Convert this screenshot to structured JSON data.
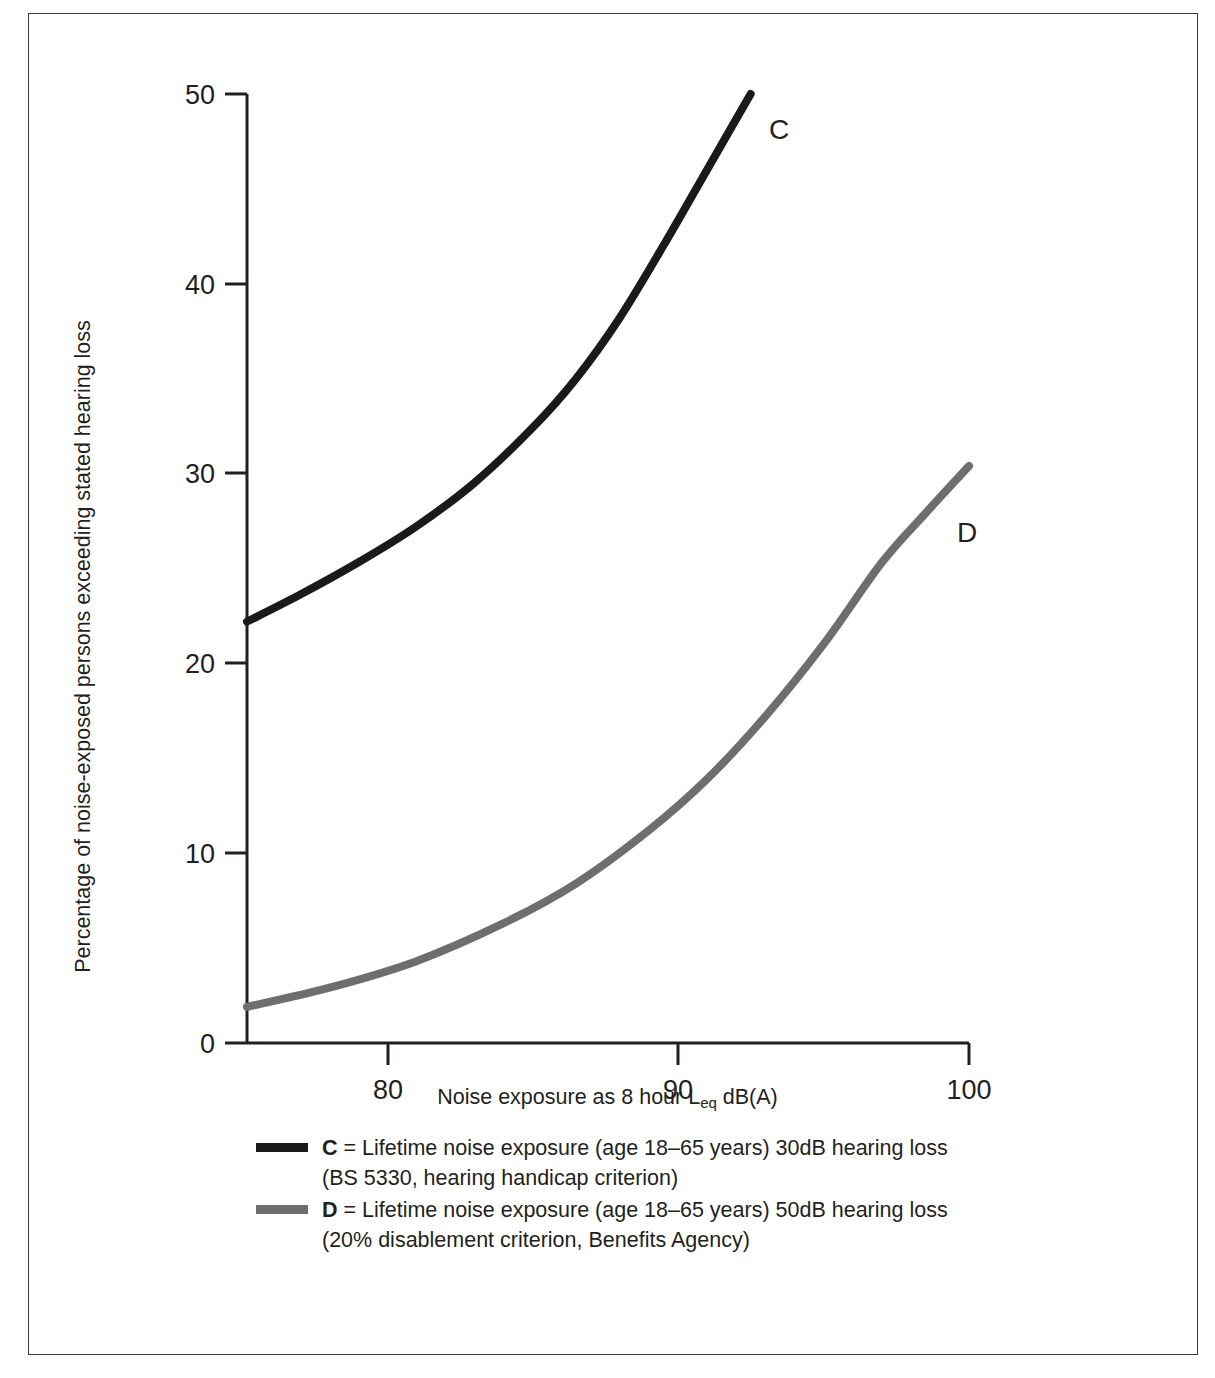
{
  "chart_data": {
    "type": "line",
    "title": "",
    "xlabel": "Noise exposure as 8 hour Leq dB(A)",
    "xlabel_main_before": "Noise exposure as 8 hour L",
    "xlabel_sub": "eq",
    "xlabel_main_after": " dB(A)",
    "ylabel": "Percentage of noise-exposed persons exceeding stated hearing loss",
    "xlim": [
      75.2,
      100
    ],
    "ylim": [
      0,
      50
    ],
    "xticks": [
      "80",
      "90",
      "100"
    ],
    "xtick_values": [
      80,
      90,
      100
    ],
    "yticks": [
      "0",
      "10",
      "20",
      "30",
      "40",
      "50"
    ],
    "ytick_values": [
      0,
      10,
      20,
      30,
      40,
      50
    ],
    "grid": false,
    "legend_position": "below-axis",
    "series": [
      {
        "name": "C",
        "label": "C",
        "color": "#1a1a1a",
        "x": [
          75.2,
          77,
          79,
          81,
          83,
          85,
          86.5,
          88,
          89.5,
          91,
          92.5
        ],
        "values": [
          22.2,
          23.6,
          25.3,
          27.2,
          29.5,
          32.4,
          35.0,
          38.2,
          42.0,
          46.0,
          50.0
        ]
      },
      {
        "name": "D",
        "label": "D",
        "color": "#6e6e6e",
        "x": [
          75.2,
          78,
          81,
          84,
          86.5,
          89,
          91,
          93,
          95,
          97,
          98.5,
          100
        ],
        "values": [
          1.9,
          2.9,
          4.3,
          6.3,
          8.4,
          11.2,
          13.9,
          17.2,
          21.0,
          25.3,
          27.9,
          30.4
        ]
      }
    ]
  },
  "legend": {
    "entries": [
      {
        "key": "C",
        "equals": " = ",
        "description": "Lifetime noise exposure (age 18–65 years) 30dB hearing loss",
        "sub": "(BS 5330, hearing handicap criterion)",
        "color": "#1a1a1a"
      },
      {
        "key": "D",
        "equals": " = ",
        "description": "Lifetime noise exposure (age 18–65 years) 50dB hearing loss",
        "sub": "(20% disablement criterion, Benefits Agency)",
        "color": "#6e6e6e"
      }
    ]
  },
  "colors": {
    "frame": "#3a3a3a",
    "axis": "#231f20",
    "series_c": "#1a1a1a",
    "series_d": "#6e6e6e",
    "background": "#ffffff"
  }
}
